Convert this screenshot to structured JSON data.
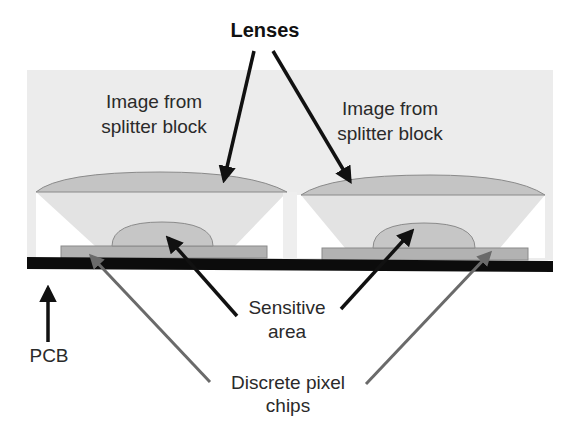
{
  "diagram": {
    "title_label": "Lenses",
    "units": [
      {
        "image_label_line1": "Image from",
        "image_label_line2": "splitter block"
      },
      {
        "image_label_line1": "Image from",
        "image_label_line2": "splitter block"
      }
    ],
    "sensitive_label_line1": "Sensitive",
    "sensitive_label_line2": "area",
    "chips_label_line1": "Discrete pixel",
    "chips_label_line2": "chips",
    "pcb_label": "PCB"
  },
  "colors": {
    "background_region": "#ececec",
    "light_cone": "#e2e2e2",
    "lens_fill": "#c4c4c4",
    "lens_stroke": "#8a8a8a",
    "chip_fill": "#b2b2b2",
    "dome_fill": "#c6c6c6",
    "pcb": "#0c0c0c",
    "arrow_black": "#111111",
    "arrow_gray": "#6a6a6a",
    "text": "#2a2a2a"
  }
}
